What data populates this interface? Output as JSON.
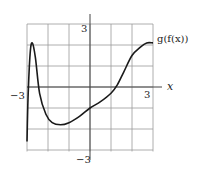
{
  "chart_data": {
    "type": "line",
    "title": "",
    "series": [
      {
        "name": "g(f(x))",
        "x": [
          -3,
          -2.95,
          -2.85,
          -2.75,
          -2.6,
          -2.4,
          -2.1,
          -1.8,
          -1.4,
          -1.0,
          -0.5,
          0,
          0.5,
          1.0,
          1.3,
          1.6,
          2.0,
          2.4,
          2.7,
          3.0
        ],
        "y": [
          -2.6,
          -0.5,
          1.6,
          2.1,
          1.4,
          -0.3,
          -1.3,
          -1.7,
          -1.8,
          -1.7,
          -1.4,
          -1.0,
          -0.7,
          -0.3,
          0.1,
          0.7,
          1.5,
          1.9,
          2.1,
          2.1
        ]
      }
    ],
    "xlabel": "x",
    "ylabel": "",
    "xlim": [
      -3,
      3
    ],
    "ylim": [
      -3,
      3
    ],
    "grid": true,
    "grid_step": 1,
    "tick_labels": {
      "x_left": "−3",
      "x_right": "3",
      "y_top": "3",
      "y_bottom": "−3"
    },
    "curve_label": "g(f(x))"
  }
}
